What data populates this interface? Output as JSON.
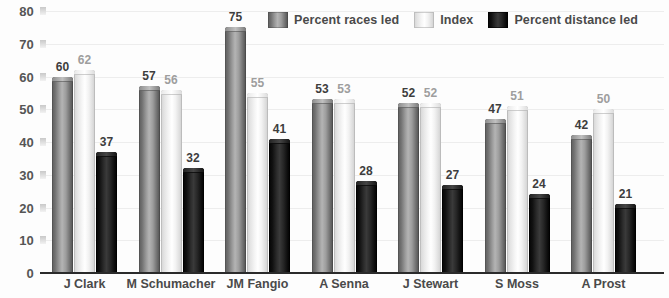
{
  "chart_data": {
    "type": "bar",
    "title": "",
    "xlabel": "",
    "ylabel": "",
    "ylim": [
      0,
      80
    ],
    "yticks": [
      0,
      10,
      20,
      30,
      40,
      50,
      60,
      70,
      80
    ],
    "grid": true,
    "legend_position": "top-center",
    "categories": [
      "J Clark",
      "M Schumacher",
      "JM Fangio",
      "A Senna",
      "J Stewart",
      "S Moss",
      "A Prost"
    ],
    "series": [
      {
        "name": "Percent races led",
        "color": "#8a8a8a",
        "values": [
          60,
          57,
          75,
          53,
          52,
          47,
          42
        ]
      },
      {
        "name": "Index",
        "color": "#f0f0f0",
        "values": [
          62,
          56,
          55,
          53,
          52,
          51,
          50
        ]
      },
      {
        "name": "Percent distance led",
        "color": "#141414",
        "values": [
          37,
          32,
          41,
          28,
          27,
          24,
          21
        ]
      }
    ]
  },
  "legend": {
    "items": [
      {
        "label": "Percent races led",
        "swatch": "legend-swatch-races-led"
      },
      {
        "label": "Index",
        "swatch": "legend-swatch-index"
      },
      {
        "label": "Percent distance led",
        "swatch": "legend-swatch-distance-led"
      }
    ]
  }
}
